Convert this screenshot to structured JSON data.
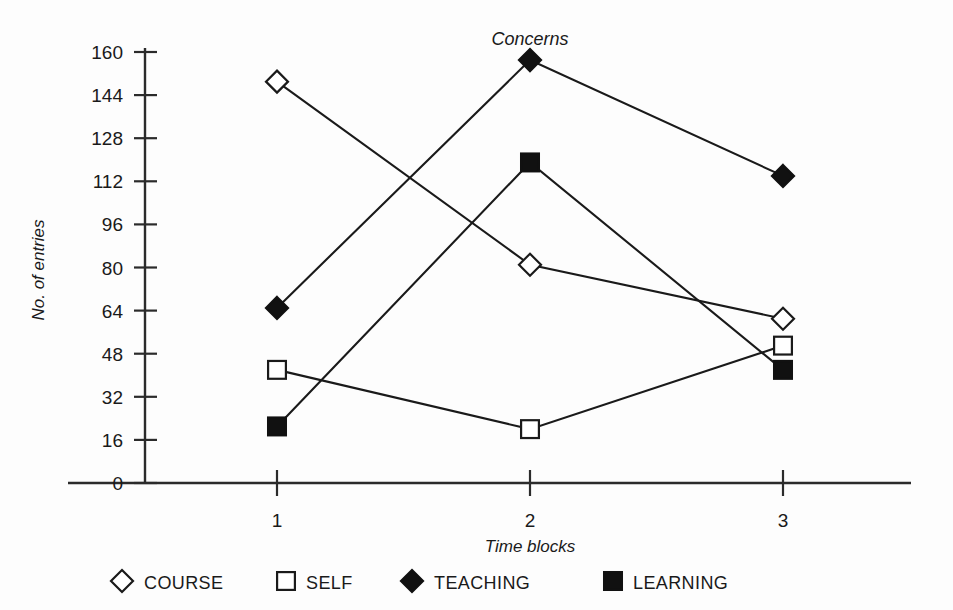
{
  "chart_data": {
    "type": "line",
    "title": "Concerns",
    "xlabel": "Time blocks",
    "ylabel": "No. of entries",
    "categories": [
      "1",
      "2",
      "3"
    ],
    "ylim": [
      0,
      160
    ],
    "yticks": [
      0,
      16,
      32,
      48,
      64,
      80,
      96,
      112,
      128,
      144,
      160
    ],
    "ytick_labels": [
      "0",
      "16",
      "32",
      "48",
      "64",
      "80",
      "96",
      "112",
      "128",
      "144",
      "160"
    ],
    "grid": false,
    "legend_position": "bottom",
    "series": [
      {
        "name": "COURSE",
        "marker": "open-diamond",
        "values": [
          149,
          81,
          61
        ]
      },
      {
        "name": "SELF",
        "marker": "open-square",
        "values": [
          42,
          20,
          51
        ]
      },
      {
        "name": "TEACHING",
        "marker": "filled-diamond",
        "values": [
          65,
          157,
          114
        ]
      },
      {
        "name": "LEARNING",
        "marker": "filled-square",
        "values": [
          21,
          119,
          42
        ]
      }
    ]
  },
  "axis": {
    "y_tick_0": "0",
    "y_tick_1": "16",
    "y_tick_2": "32",
    "y_tick_3": "48",
    "y_tick_4": "64",
    "y_tick_5": "80",
    "y_tick_6": "96",
    "y_tick_7": "112",
    "y_tick_8": "128",
    "y_tick_9": "144",
    "y_tick_10": "160",
    "x_tick_0": "1",
    "x_tick_1": "2",
    "x_tick_2": "3"
  },
  "legend": {
    "items": [
      {
        "label": "COURSE"
      },
      {
        "label": "SELF"
      },
      {
        "label": "TEACHING"
      },
      {
        "label": "LEARNING"
      }
    ]
  },
  "colors": {
    "ink": "#1a1a1a",
    "background": "#fdfdfd",
    "marker_fill_open": "#ffffff",
    "marker_fill_solid": "#111111"
  }
}
